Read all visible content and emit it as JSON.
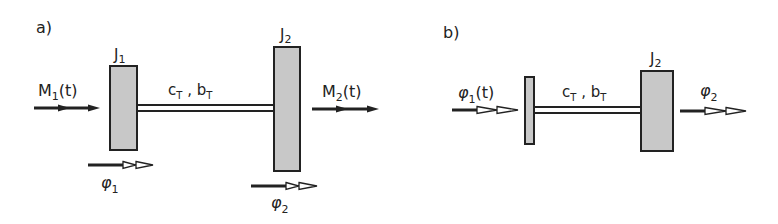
{
  "diagram": {
    "type": "two-mass torsional oscillator schematic",
    "colors": {
      "stroke": "#222222",
      "disk_fill": "#c8c8c8",
      "background": "#ffffff"
    },
    "panel_a": {
      "label": "a)",
      "disk1": {
        "label": "J",
        "sub": "1"
      },
      "disk2": {
        "label": "J",
        "sub": "2"
      },
      "shaft": {
        "c": "c",
        "c_sub": "T",
        "sep": " , ",
        "b": "b",
        "b_sub": "T"
      },
      "input_torque": {
        "sym": "M",
        "sub": "1",
        "arg": "(t)"
      },
      "output_torque": {
        "sym": "M",
        "sub": "2",
        "arg": "(t)"
      },
      "angle1": {
        "sym": "φ",
        "sub": "1"
      },
      "angle2": {
        "sym": "φ",
        "sub": "2"
      }
    },
    "panel_b": {
      "label": "b)",
      "disk2": {
        "label": "J",
        "sub": "2"
      },
      "shaft": {
        "c": "c",
        "c_sub": "T",
        "sep": " , ",
        "b": "b",
        "b_sub": "T"
      },
      "input_angle": {
        "sym": "φ",
        "sub": "1",
        "arg": "(t)"
      },
      "output_angle": {
        "sym": "φ",
        "sub": "2"
      }
    }
  }
}
